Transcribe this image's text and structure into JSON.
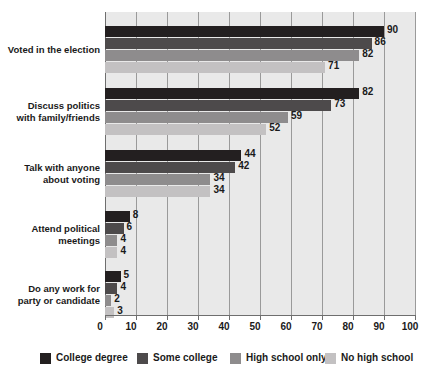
{
  "chart_data": {
    "type": "bar",
    "orientation": "horizontal",
    "title": "",
    "subtitle": "",
    "xlabel": "",
    "ylabel": "",
    "xlim": [
      0,
      100
    ],
    "xticks": [
      "0",
      "10",
      "20",
      "30",
      "40",
      "50",
      "60",
      "70",
      "80",
      "90",
      "100"
    ],
    "grid": true,
    "legend_position": "bottom",
    "categories": [
      "Voted in the election",
      "Discuss politics with family/friends",
      "Talk with anyone about voting",
      "Attend political meetings",
      "Do any work for party or candidate"
    ],
    "category_lines": [
      [
        "Voted in the election"
      ],
      [
        "Discuss politics",
        "with family/friends"
      ],
      [
        "Talk with anyone",
        "about voting"
      ],
      [
        "Attend political",
        "meetings"
      ],
      [
        "Do any work for",
        "party or candidate"
      ]
    ],
    "series": [
      {
        "name": "College degree",
        "color": "#231f20",
        "values": [
          90,
          82,
          44,
          8,
          5
        ]
      },
      {
        "name": "Some college",
        "color": "#4d4a4b",
        "values": [
          86,
          73,
          42,
          6,
          4
        ]
      },
      {
        "name": "High school only",
        "color": "#8e8c8d",
        "values": [
          82,
          59,
          34,
          4,
          2
        ]
      },
      {
        "name": "No high school",
        "color": "#c3c1c2",
        "values": [
          71,
          52,
          34,
          4,
          3
        ]
      }
    ]
  },
  "legend": {
    "items": [
      {
        "label": "College degree",
        "color": "#231f20"
      },
      {
        "label": "Some college",
        "color": "#4d4a4b"
      },
      {
        "label": "High school only",
        "color": "#8e8c8d"
      },
      {
        "label": "No high school",
        "color": "#c3c1c2"
      }
    ]
  },
  "style": {
    "plot_background": "#e9e9e9",
    "page_background": "#ffffff",
    "gridline_color": "#9a9a9a",
    "axis_color": "#6e6e6e",
    "text_color": "#1a1a1a"
  }
}
